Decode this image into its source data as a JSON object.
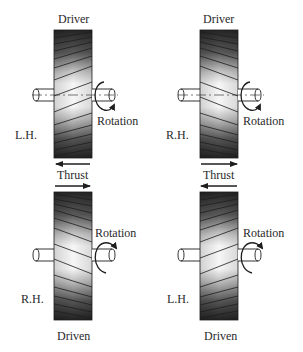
{
  "diagram": {
    "panels": [
      {
        "id": "top-left",
        "role_label": "Driver",
        "hand_label": "L.H.",
        "rotation_label": "Rotation",
        "thrust_dir": "left",
        "rotation_dir": "cw-down"
      },
      {
        "id": "top-right",
        "role_label": "Driver",
        "hand_label": "R.H.",
        "rotation_label": "Rotation",
        "thrust_dir": "right",
        "rotation_dir": "cw-down"
      },
      {
        "id": "bottom-left",
        "role_label": "Driven",
        "hand_label": "R.H.",
        "rotation_label": "Rotation",
        "thrust_dir": "right",
        "rotation_dir": "up"
      },
      {
        "id": "bottom-right",
        "role_label": "Driven",
        "hand_label": "L.H.",
        "rotation_label": "Rotation",
        "thrust_dir": "left",
        "rotation_dir": "up"
      }
    ],
    "thrust_labels": [
      {
        "id": "left",
        "text": "Thrust"
      },
      {
        "id": "right",
        "text": "Thrust"
      }
    ]
  },
  "colors": {
    "ink": "#1e1e1e",
    "gear_dark": "#2b2b2b",
    "gear_light": "#f4f4f4",
    "background": "#ffffff"
  }
}
